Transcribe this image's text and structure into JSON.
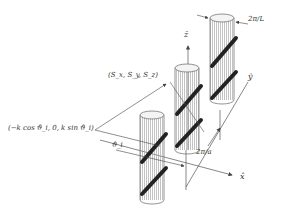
{
  "diagram": {
    "type": "3d-schematic",
    "labels": {
      "period_L": "2π/L",
      "period_a": "2π/a",
      "z_axis": "ẑ",
      "y_axis": "ŷ",
      "x_axis": "x̂",
      "spin": "(S_x, S_y, S_z)",
      "wavevector": "(−k cos ϑ_i, 0, k sin ϑ_i)",
      "angle": "ϑ_i"
    },
    "cylinders": [
      {
        "name": "front",
        "cx": 152,
        "top": 115,
        "bottom": 200,
        "rx": 12
      },
      {
        "name": "middle",
        "cx": 187,
        "top": 68,
        "bottom": 150,
        "rx": 12
      },
      {
        "name": "back",
        "cx": 222,
        "top": 18,
        "bottom": 100,
        "rx": 12
      }
    ],
    "colors": {
      "stroke": "#555555",
      "hatch": "#999999",
      "stripe": "#222222",
      "text": "#333333"
    }
  }
}
